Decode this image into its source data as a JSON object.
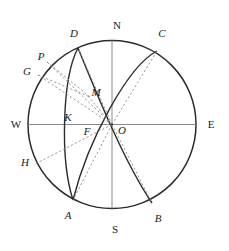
{
  "figure": {
    "kind": "geometric-diagram",
    "background": "#ffffff",
    "stroke_solid": "#2b2b2b",
    "stroke_thin": "#7a7a7a",
    "stroke_dashed": "#8c8c8c",
    "label_color": "#1b1b1b",
    "width": 229,
    "height": 251
  },
  "geometry": {
    "center": {
      "x": 112,
      "y": 124.5
    },
    "radius": 84,
    "horizon_line": {
      "x1": 28,
      "y1": 124.5,
      "x2": 196,
      "y2": 124.5
    },
    "meridian_line": {
      "x1": 112,
      "y1": 40.5,
      "x2": 112,
      "y2": 208.5
    }
  },
  "points": {
    "N": {
      "x": 112,
      "y": 40.5,
      "label_x": 117,
      "label_y": 25,
      "italic": false
    },
    "S": {
      "x": 112,
      "y": 208.5,
      "label_x": 115,
      "label_y": 229,
      "italic": false
    },
    "W": {
      "x": 28,
      "y": 124.5,
      "label_x": 16,
      "label_y": 124,
      "italic": false
    },
    "E": {
      "x": 196,
      "y": 124.5,
      "label_x": 210,
      "label_y": 124,
      "italic": false
    },
    "D": {
      "x": 78,
      "y": 48,
      "label_x": 74,
      "label_y": 33,
      "italic": true
    },
    "C": {
      "x": 157,
      "y": 51,
      "label_x": 162,
      "label_y": 33,
      "italic": true
    },
    "A": {
      "x": 73,
      "y": 200,
      "label_x": 68,
      "label_y": 215,
      "italic": true
    },
    "B": {
      "x": 152,
      "y": 203,
      "label_x": 158,
      "label_y": 218,
      "italic": true
    },
    "P": {
      "x": 47,
      "y": 62,
      "label_x": 41,
      "label_y": 56,
      "italic": true
    },
    "G": {
      "x": 38,
      "y": 75,
      "label_x": 27,
      "label_y": 71,
      "italic": true
    },
    "H": {
      "x": 35,
      "y": 164,
      "label_x": 25,
      "label_y": 162,
      "italic": true
    },
    "M": {
      "x": 88,
      "y": 96,
      "label_x": 94,
      "label_y": 92,
      "italic": true
    },
    "K": {
      "x": 76,
      "y": 118,
      "label_x": 68,
      "label_y": 117,
      "italic": true
    },
    "F": {
      "x": 94,
      "y": 131,
      "label_x": 87,
      "label_y": 129,
      "italic": true
    },
    "O": {
      "x": 112,
      "y": 124.5,
      "label_x": 121,
      "label_y": 129,
      "italic": true
    }
  },
  "labels": [
    {
      "id": "N",
      "text": "N"
    },
    {
      "id": "S",
      "text": "S"
    },
    {
      "id": "W",
      "text": "W"
    },
    {
      "id": "E",
      "text": "E"
    },
    {
      "id": "D",
      "text": "D"
    },
    {
      "id": "C",
      "text": "C"
    },
    {
      "id": "A",
      "text": "A"
    },
    {
      "id": "B",
      "text": "B"
    },
    {
      "id": "P",
      "text": "P"
    },
    {
      "id": "G",
      "text": "G"
    },
    {
      "id": "H",
      "text": "H"
    },
    {
      "id": "M",
      "text": "M"
    },
    {
      "id": "K",
      "text": "K"
    },
    {
      "id": "F",
      "text": "F"
    },
    {
      "id": "O",
      "text": "O"
    }
  ],
  "curves": {
    "arc_D_A": "M 78 48 C 62 78, 60 160, 73 200",
    "arc_D_B": "M 78 48 C 96 92, 124 162, 152 203",
    "arc_C_A": "M 157 51 C 128 66, 88 140, 73 200",
    "arc_C_K_S": "M 157 51 C 120 64, 80 108, 76 118"
  },
  "rays_dashed": [
    {
      "name": "ray-O-D",
      "x1": 112,
      "y1": 124.5,
      "x2": 78,
      "y2": 48
    },
    {
      "name": "ray-O-C",
      "x1": 112,
      "y1": 124.5,
      "x2": 157,
      "y2": 51
    },
    {
      "name": "ray-O-A",
      "x1": 112,
      "y1": 124.5,
      "x2": 73,
      "y2": 200
    },
    {
      "name": "ray-O-B",
      "x1": 112,
      "y1": 124.5,
      "x2": 152,
      "y2": 203
    },
    {
      "name": "ray-O-P",
      "x1": 112,
      "y1": 124.5,
      "x2": 47,
      "y2": 62
    },
    {
      "name": "ray-O-G",
      "x1": 112,
      "y1": 124.5,
      "x2": 38,
      "y2": 75
    },
    {
      "name": "ray-O-H",
      "x1": 112,
      "y1": 124.5,
      "x2": 35,
      "y2": 164
    },
    {
      "name": "ray-P-M",
      "x1": 47,
      "y1": 62,
      "x2": 88,
      "y2": 96
    },
    {
      "name": "ray-G-M",
      "x1": 38,
      "y1": 75,
      "x2": 88,
      "y2": 96
    },
    {
      "name": "ray-M-O",
      "x1": 88,
      "y1": 96,
      "x2": 112,
      "y2": 124.5
    },
    {
      "name": "ray-N-O",
      "x1": 112,
      "y1": 40.5,
      "x2": 112,
      "y2": 124.5
    }
  ]
}
